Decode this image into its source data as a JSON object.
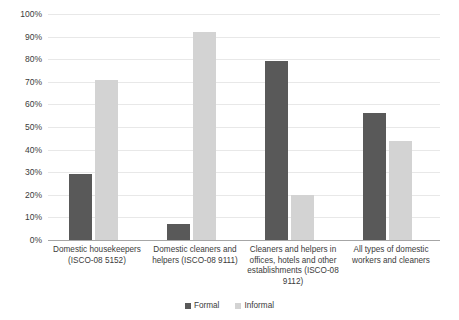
{
  "chart_data": {
    "type": "bar",
    "title": "",
    "subtitle": "",
    "xlabel": "",
    "ylabel": "",
    "ylim": [
      0,
      100
    ],
    "yunit": "%",
    "grid": true,
    "legend_position": "bottom-center",
    "categories": [
      "Domestic housekeepers (ISCO-08 5152)",
      "Domestic cleaners and helpers (ISCO-08 9111)",
      "Cleaners and helpers in offices, hotels and other establishments (ISCO-08 9112)",
      "All types of domestic workers and cleaners"
    ],
    "category_lines": [
      [
        "Domestic housekeepers",
        "(ISCO-08 5152)"
      ],
      [
        "Domestic cleaners and",
        "helpers (ISCO-08 9111)"
      ],
      [
        "Cleaners and helpers in",
        "offices, hotels and other",
        "establishments (ISCO-08",
        "9112)"
      ],
      [
        "All types of domestic",
        "workers and cleaners"
      ]
    ],
    "series": [
      {
        "name": "Formal",
        "color": "#595959",
        "values": [
          29,
          7,
          79,
          56
        ]
      },
      {
        "name": "Informal",
        "color": "#d3d3d3",
        "values": [
          71,
          92,
          20,
          44
        ]
      }
    ],
    "ytick_labels": [
      "100%",
      "90%",
      "80%",
      "70%",
      "60%",
      "50%",
      "40%",
      "30%",
      "20%",
      "10%",
      "0%"
    ],
    "ytick_values": [
      100,
      90,
      80,
      70,
      60,
      50,
      40,
      30,
      20,
      10,
      0
    ]
  },
  "legend": {
    "items": [
      {
        "label": "Formal"
      },
      {
        "label": "Informal"
      }
    ]
  }
}
